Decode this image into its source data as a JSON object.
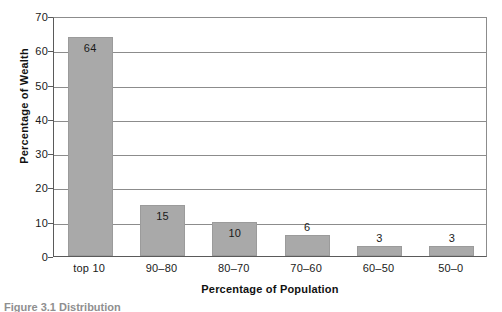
{
  "chart_data": {
    "type": "bar",
    "title": "",
    "xlabel": "Percentage of Population",
    "ylabel": "Percentage of Wealth",
    "categories": [
      "top 10",
      "90–80",
      "80–70",
      "70–60",
      "60–50",
      "50–0"
    ],
    "values": [
      64,
      15,
      10,
      6,
      3,
      3
    ],
    "value_labels": [
      "64",
      "15",
      "10",
      "6",
      "3",
      "3"
    ],
    "ylim": [
      0,
      70
    ],
    "yticks": [
      0,
      10,
      20,
      30,
      40,
      50,
      60,
      70
    ],
    "ytick_labels": [
      "0",
      "10",
      "20",
      "30",
      "40",
      "50",
      "60",
      "70"
    ],
    "grid": true,
    "grid_axis": "y",
    "legend": false,
    "bar_color": "#a9a9a9",
    "grid_color": "#8c8c8c",
    "axis_color": "#5a5a5a",
    "text_color": "#1a1a1a"
  },
  "caption": {
    "text": "Figure 3.1   Distribution"
  }
}
